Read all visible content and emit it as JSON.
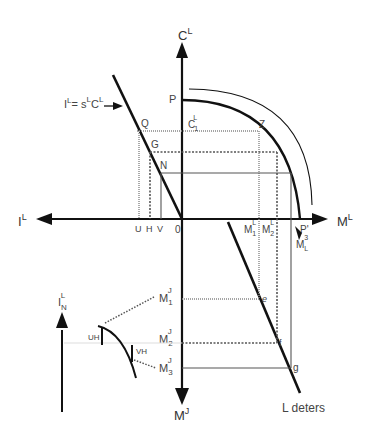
{
  "diagram": {
    "colors": {
      "line": "#111111",
      "grid": "#777777",
      "text": "#444444",
      "background": "#ffffff"
    },
    "axes": {
      "up": {
        "base": "C",
        "sup": "L"
      },
      "down": {
        "base": "M",
        "sup": "J"
      },
      "left": {
        "base": "I",
        "sup": "L"
      },
      "right": {
        "base": "M",
        "sup": "L"
      },
      "origin": "0"
    },
    "equation": {
      "I": "I",
      "I_sup": "L",
      "eq": "= s",
      "s_sup": "L",
      "C": "C",
      "C_sup": "L"
    },
    "points": {
      "P": "P",
      "Q": "Q",
      "G": "G",
      "N": "N",
      "Z": "Z",
      "C1": {
        "base": "C",
        "sub": "1",
        "sup": "L"
      },
      "P_prime": "P'",
      "e": "e",
      "f": "f",
      "g": "g"
    },
    "x_ticks_left": {
      "U": "U",
      "H": "H",
      "V": "V"
    },
    "x_ticks_right": {
      "M1": {
        "base": "M",
        "sub": "1",
        "sup": "L"
      },
      "M2": {
        "base": "M",
        "sub": "2",
        "sup": "L"
      },
      "ML3": {
        "base": "M",
        "sub": "L",
        "sup": "3"
      }
    },
    "y_ticks_down": {
      "M1J": {
        "base": "M",
        "sub": "1",
        "sup": "J"
      },
      "M2J": {
        "base": "M",
        "sub": "2",
        "sup": "J"
      },
      "M3J": {
        "base": "M",
        "sub": "3",
        "sup": "J"
      }
    },
    "inset": {
      "axis": {
        "base": "I",
        "sub": "N",
        "sup": "L"
      },
      "UH": "UH",
      "VH": "VH"
    },
    "line_label": "L deters"
  }
}
